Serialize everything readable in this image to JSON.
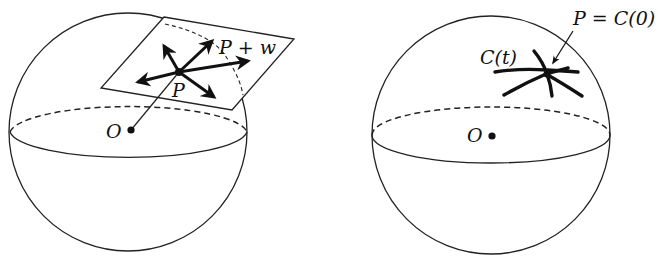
{
  "figure": {
    "left_panel": {
      "description": "Sphere with tangent plane at P and tangent vectors",
      "labels": {
        "origin": "O",
        "point": "P",
        "vector_tip": "P + w"
      }
    },
    "right_panel": {
      "description": "Sphere with curves through P on the surface",
      "labels": {
        "origin": "O",
        "curve": "C(t)",
        "point_eq": "P = C(0)"
      }
    },
    "caption": ""
  }
}
